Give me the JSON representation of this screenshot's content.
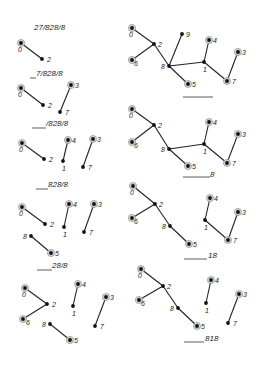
{
  "figure": {
    "panels": [
      {
        "id": "L1",
        "label": "27/828/8",
        "label_pos": [
          34,
          30
        ],
        "underline": null,
        "nodes": [
          {
            "id": "0",
            "x": 21,
            "y": 43,
            "root": true,
            "lx": -3,
            "ly": 9
          },
          {
            "id": "2",
            "x": 42,
            "y": 59,
            "root": false,
            "lx": 5,
            "ly": 3
          }
        ],
        "edges": [
          [
            "0",
            "2"
          ]
        ]
      },
      {
        "id": "L2",
        "label": "7/828/8",
        "label_pos": [
          36,
          76
        ],
        "underline": [
          30,
          36,
          78
        ],
        "nodes": [
          {
            "id": "0",
            "x": 21,
            "y": 88,
            "root": true,
            "lx": -3,
            "ly": 9
          },
          {
            "id": "2",
            "x": 43,
            "y": 105,
            "root": false,
            "lx": 5,
            "ly": 3
          },
          {
            "id": "3",
            "x": 71,
            "y": 85,
            "root": true,
            "lx": 4,
            "ly": 3
          },
          {
            "id": "7",
            "x": 60,
            "y": 112,
            "root": false,
            "lx": 5,
            "ly": 3
          }
        ],
        "edges": [
          [
            "0",
            "2"
          ],
          [
            "3",
            "7"
          ]
        ]
      },
      {
        "id": "L3",
        "label": "/828/8",
        "label_pos": [
          46,
          126
        ],
        "underline": [
          32,
          46,
          128
        ],
        "nodes": [
          {
            "id": "0",
            "x": 22,
            "y": 143,
            "root": true,
            "lx": -3,
            "ly": 9
          },
          {
            "id": "2",
            "x": 44,
            "y": 159,
            "root": false,
            "lx": 5,
            "ly": 3
          },
          {
            "id": "4",
            "x": 68,
            "y": 140,
            "root": true,
            "lx": 4,
            "ly": 3
          },
          {
            "id": "1",
            "x": 63,
            "y": 161,
            "root": false,
            "lx": -1,
            "ly": 10
          },
          {
            "id": "3",
            "x": 93,
            "y": 139,
            "root": true,
            "lx": 4,
            "ly": 3
          },
          {
            "id": "7",
            "x": 83,
            "y": 167,
            "root": false,
            "lx": 5,
            "ly": 3
          }
        ],
        "edges": [
          [
            "0",
            "2"
          ],
          [
            "4",
            "1"
          ],
          [
            "3",
            "7"
          ]
        ]
      },
      {
        "id": "L4",
        "label": "828/8",
        "label_pos": [
          48,
          187
        ],
        "underline": [
          36,
          48,
          189
        ],
        "nodes": [
          {
            "id": "0",
            "x": 22,
            "y": 207,
            "root": true,
            "lx": -3,
            "ly": 9
          },
          {
            "id": "2",
            "x": 45,
            "y": 224,
            "root": false,
            "lx": 5,
            "ly": 3
          },
          {
            "id": "4",
            "x": 69,
            "y": 204,
            "root": true,
            "lx": 4,
            "ly": 3
          },
          {
            "id": "1",
            "x": 64,
            "y": 227,
            "root": false,
            "lx": -1,
            "ly": 10
          },
          {
            "id": "3",
            "x": 94,
            "y": 204,
            "root": true,
            "lx": 4,
            "ly": 3
          },
          {
            "id": "7",
            "x": 84,
            "y": 232,
            "root": false,
            "lx": 5,
            "ly": 3
          },
          {
            "id": "8",
            "x": 31,
            "y": 236,
            "root": false,
            "lx": -8,
            "ly": 3
          },
          {
            "id": "5",
            "x": 51,
            "y": 253,
            "root": true,
            "lx": 4,
            "ly": 3
          }
        ],
        "edges": [
          [
            "0",
            "2"
          ],
          [
            "4",
            "1"
          ],
          [
            "3",
            "7"
          ],
          [
            "8",
            "5"
          ]
        ]
      },
      {
        "id": "L5",
        "label": "28/8",
        "label_pos": [
          52,
          268
        ],
        "underline": [
          37,
          52,
          270
        ],
        "nodes": [
          {
            "id": "0",
            "x": 25,
            "y": 288,
            "root": true,
            "lx": -3,
            "ly": 9
          },
          {
            "id": "2",
            "x": 47,
            "y": 304,
            "root": false,
            "lx": 5,
            "ly": 3
          },
          {
            "id": "6",
            "x": 23,
            "y": 319,
            "root": true,
            "lx": 3,
            "ly": 6
          },
          {
            "id": "4",
            "x": 78,
            "y": 284,
            "root": true,
            "lx": 4,
            "ly": 3
          },
          {
            "id": "1",
            "x": 73,
            "y": 306,
            "root": false,
            "lx": -1,
            "ly": 10
          },
          {
            "id": "3",
            "x": 106,
            "y": 297,
            "root": true,
            "lx": 4,
            "ly": 3
          },
          {
            "id": "7",
            "x": 95,
            "y": 326,
            "root": false,
            "lx": 5,
            "ly": 3
          },
          {
            "id": "8",
            "x": 50,
            "y": 324,
            "root": false,
            "lx": -8,
            "ly": 3
          },
          {
            "id": "5",
            "x": 70,
            "y": 340,
            "root": true,
            "lx": 4,
            "ly": 3
          }
        ],
        "edges": [
          [
            "0",
            "2"
          ],
          [
            "6",
            "2"
          ],
          [
            "4",
            "1"
          ],
          [
            "3",
            "7"
          ],
          [
            "8",
            "5"
          ]
        ]
      },
      {
        "id": "R1",
        "label": "",
        "label_pos": [
          213,
          97
        ],
        "underline": [
          183,
          213,
          97
        ],
        "nodes": [
          {
            "id": "0",
            "x": 132,
            "y": 28,
            "root": true,
            "lx": -3,
            "ly": 9
          },
          {
            "id": "2",
            "x": 154,
            "y": 44,
            "root": false,
            "lx": 4,
            "ly": 3
          },
          {
            "id": "6",
            "x": 132,
            "y": 60,
            "root": true,
            "lx": 2,
            "ly": 6
          },
          {
            "id": "9",
            "x": 182,
            "y": 34,
            "root": false,
            "lx": 4,
            "ly": 3
          },
          {
            "id": "8",
            "x": 169,
            "y": 66,
            "root": false,
            "lx": -8,
            "ly": 3
          },
          {
            "id": "4",
            "x": 209,
            "y": 40,
            "root": true,
            "lx": 4,
            "ly": 3
          },
          {
            "id": "1",
            "x": 204,
            "y": 62,
            "root": false,
            "lx": -1,
            "ly": 10
          },
          {
            "id": "3",
            "x": 238,
            "y": 52,
            "root": true,
            "lx": 4,
            "ly": 3
          },
          {
            "id": "7",
            "x": 227,
            "y": 81,
            "root": true,
            "lx": 5,
            "ly": 3
          },
          {
            "id": "5",
            "x": 188,
            "y": 84,
            "root": true,
            "lx": 4,
            "ly": 3
          }
        ],
        "edges": [
          [
            "0",
            "2"
          ],
          [
            "6",
            "2"
          ],
          [
            "2",
            "8"
          ],
          [
            "9",
            "8"
          ],
          [
            "8",
            "1"
          ],
          [
            "8",
            "5"
          ],
          [
            "4",
            "1"
          ],
          [
            "1",
            "7"
          ],
          [
            "3",
            "7"
          ]
        ]
      },
      {
        "id": "R2",
        "label": "8",
        "label_pos": [
          210,
          177
        ],
        "underline": [
          183,
          210,
          177
        ],
        "nodes": [
          {
            "id": "0",
            "x": 132,
            "y": 109,
            "root": true,
            "lx": -3,
            "ly": 9
          },
          {
            "id": "2",
            "x": 154,
            "y": 125,
            "root": false,
            "lx": 4,
            "ly": 3
          },
          {
            "id": "6",
            "x": 132,
            "y": 142,
            "root": true,
            "lx": 2,
            "ly": 6
          },
          {
            "id": "8",
            "x": 169,
            "y": 149,
            "root": false,
            "lx": -8,
            "ly": 3
          },
          {
            "id": "5",
            "x": 188,
            "y": 166,
            "root": true,
            "lx": 4,
            "ly": 3
          },
          {
            "id": "4",
            "x": 209,
            "y": 122,
            "root": true,
            "lx": 4,
            "ly": 3
          },
          {
            "id": "1",
            "x": 204,
            "y": 144,
            "root": false,
            "lx": -1,
            "ly": 10
          },
          {
            "id": "3",
            "x": 238,
            "y": 134,
            "root": true,
            "lx": 4,
            "ly": 3
          },
          {
            "id": "7",
            "x": 227,
            "y": 163,
            "root": true,
            "lx": 5,
            "ly": 3
          }
        ],
        "edges": [
          [
            "0",
            "2"
          ],
          [
            "6",
            "2"
          ],
          [
            "2",
            "8"
          ],
          [
            "8",
            "5"
          ],
          [
            "8",
            "1"
          ],
          [
            "4",
            "1"
          ],
          [
            "1",
            "7"
          ],
          [
            "3",
            "7"
          ]
        ]
      },
      {
        "id": "R3",
        "label": "18",
        "label_pos": [
          208,
          258
        ],
        "underline": [
          184,
          207,
          259
        ],
        "nodes": [
          {
            "id": "0",
            "x": 133,
            "y": 186,
            "root": true,
            "lx": -3,
            "ly": 9
          },
          {
            "id": "2",
            "x": 155,
            "y": 204,
            "root": false,
            "lx": 4,
            "ly": 3
          },
          {
            "id": "6",
            "x": 132,
            "y": 218,
            "root": true,
            "lx": 2,
            "ly": 6
          },
          {
            "id": "8",
            "x": 170,
            "y": 226,
            "root": false,
            "lx": -8,
            "ly": 3
          },
          {
            "id": "5",
            "x": 189,
            "y": 244,
            "root": true,
            "lx": 4,
            "ly": 3
          },
          {
            "id": "4",
            "x": 210,
            "y": 198,
            "root": true,
            "lx": 4,
            "ly": 3
          },
          {
            "id": "1",
            "x": 205,
            "y": 220,
            "root": false,
            "lx": -1,
            "ly": 10
          },
          {
            "id": "3",
            "x": 238,
            "y": 212,
            "root": true,
            "lx": 4,
            "ly": 3
          },
          {
            "id": "7",
            "x": 228,
            "y": 240,
            "root": true,
            "lx": 5,
            "ly": 3
          }
        ],
        "edges": [
          [
            "0",
            "2"
          ],
          [
            "6",
            "2"
          ],
          [
            "2",
            "8"
          ],
          [
            "8",
            "5"
          ],
          [
            "4",
            "1"
          ],
          [
            "1",
            "7"
          ],
          [
            "3",
            "7"
          ]
        ]
      },
      {
        "id": "R4",
        "label": "818",
        "label_pos": [
          205,
          341
        ],
        "underline": [
          184,
          204,
          342
        ],
        "nodes": [
          {
            "id": "0",
            "x": 141,
            "y": 269,
            "root": true,
            "lx": -3,
            "ly": 9
          },
          {
            "id": "2",
            "x": 163,
            "y": 286,
            "root": false,
            "lx": 4,
            "ly": 3
          },
          {
            "id": "6",
            "x": 139,
            "y": 300,
            "root": true,
            "lx": 2,
            "ly": 6
          },
          {
            "id": "8",
            "x": 178,
            "y": 308,
            "root": false,
            "lx": -8,
            "ly": 3
          },
          {
            "id": "5",
            "x": 197,
            "y": 326,
            "root": true,
            "lx": 4,
            "ly": 3
          },
          {
            "id": "4",
            "x": 211,
            "y": 280,
            "root": true,
            "lx": 4,
            "ly": 3
          },
          {
            "id": "1",
            "x": 206,
            "y": 303,
            "root": false,
            "lx": -1,
            "ly": 10
          },
          {
            "id": "3",
            "x": 239,
            "y": 294,
            "root": true,
            "lx": 4,
            "ly": 3
          },
          {
            "id": "7",
            "x": 228,
            "y": 323,
            "root": false,
            "lx": 5,
            "ly": 3
          }
        ],
        "edges": [
          [
            "0",
            "2"
          ],
          [
            "6",
            "2"
          ],
          [
            "2",
            "8"
          ],
          [
            "8",
            "5"
          ],
          [
            "4",
            "1"
          ],
          [
            "3",
            "7"
          ]
        ]
      }
    ]
  }
}
